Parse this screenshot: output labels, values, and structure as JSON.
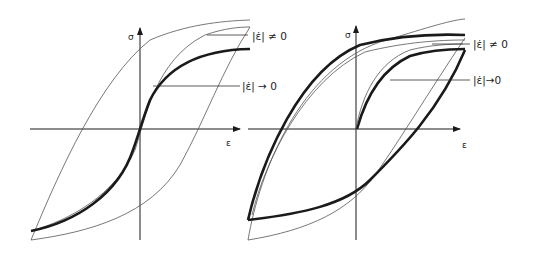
{
  "figure": {
    "panels": [
      {
        "id": "left",
        "description": "Cyclic stress-strain loops without initial loading branch (symmetric S-shaped hysteresis)",
        "y_axis_label": "σ",
        "x_axis_label": "ε",
        "legend": [
          {
            "label": "|ε̇| ≠ 0",
            "refers_to": "thin outer loop (rate-dependent)"
          },
          {
            "label": "|ε̇| → 0",
            "refers_to": "thick S-curve (quasi-static)"
          }
        ]
      },
      {
        "id": "right",
        "description": "Hysteresis loops with initial loading branch from origin",
        "y_axis_label": "σ",
        "x_axis_label": "ε",
        "legend": [
          {
            "label": "|ε̇| ≠ 0",
            "refers_to": "thin loop (rate-dependent)"
          },
          {
            "label": "|ε̇|→0",
            "refers_to": "thick loop (quasi-static)"
          }
        ]
      }
    ],
    "colors": {
      "line": "#1a1a1a",
      "thin_line": "#555555",
      "background": "#ffffff"
    }
  }
}
